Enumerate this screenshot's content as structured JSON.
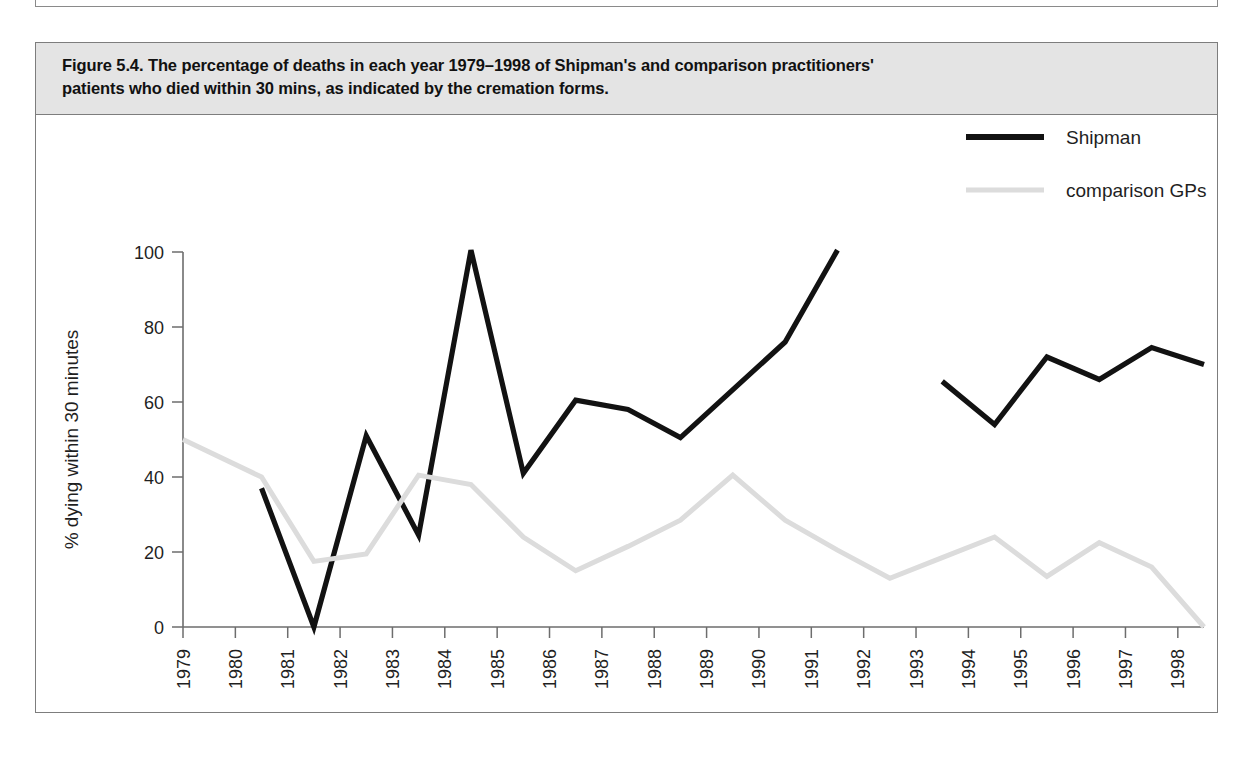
{
  "figure": {
    "caption_line1": "Figure 5.4. The percentage of deaths in each year 1979–1998 of Shipman's and comparison practitioners'",
    "caption_line2": "patients who died within 30 mins, as indicated by the cremation forms.",
    "caption_full": "Figure 5.4. The percentage of deaths in each year 1979–1998 of Shipman's and comparison practitioners' patients who died within 30 mins, as indicated by the cremation forms."
  },
  "colors": {
    "shipman": "#121212",
    "comparison": "#dcdcdc",
    "axis": "#6d6d6d",
    "caption_background": "#e4e4e4",
    "frame": "#7d7d7d",
    "text": "#1f1f1f"
  },
  "chart_data": {
    "type": "line",
    "title": "The percentage of deaths in each year 1979–1998 of Shipman's and comparison practitioners' patients who died within 30 mins, as indicated by the cremation forms.",
    "xlabel": "year",
    "ylabel": "% dying within 30 minutes",
    "xlim": [
      1979,
      1998.5
    ],
    "ylim": [
      0,
      100
    ],
    "yticks": [
      0,
      20,
      40,
      60,
      80,
      100
    ],
    "ytick_labels": [
      "0",
      "20",
      "40",
      "60",
      "80",
      "100"
    ],
    "xticks": [
      1979,
      1980,
      1981,
      1982,
      1983,
      1984,
      1985,
      1986,
      1987,
      1988,
      1989,
      1990,
      1991,
      1992,
      1993,
      1994,
      1995,
      1996,
      1997,
      1998
    ],
    "xtick_labels": [
      "1979",
      "1980",
      "1981",
      "1982",
      "1983",
      "1984",
      "1985",
      "1986",
      "1987",
      "1988",
      "1989",
      "1990",
      "1991",
      "1992",
      "1993",
      "1994",
      "1995",
      "1996",
      "1997",
      "1998"
    ],
    "grid": false,
    "legend_position": "top-right",
    "series": [
      {
        "name": "Shipman",
        "color": "#121212",
        "stroke_width": 5.2,
        "segments": [
          {
            "x": [
              1980.5,
              1981.5,
              1982.5,
              1983.5,
              1984.5,
              1985.5,
              1986.5,
              1987.5,
              1988.5,
              1990.5,
              1991.5
            ],
            "y": [
              37,
              0,
              51,
              24.5,
              100.5,
              41,
              60.5,
              58,
              50.5,
              76,
              100.5
            ]
          },
          {
            "x": [
              1993.5,
              1994.5,
              1995.5,
              1996.5,
              1997.5,
              1998.5
            ],
            "y": [
              65.5,
              54,
              72,
              66,
              74.5,
              70
            ]
          }
        ]
      },
      {
        "name": "comparison GPs",
        "color": "#dcdcdc",
        "stroke_width": 5.0,
        "segments": [
          {
            "x": [
              1979.0,
              1980.5,
              1981.5,
              1982.5,
              1983.5,
              1984.5,
              1985.5,
              1986.5,
              1987.5,
              1988.5,
              1989.5,
              1990.5,
              1991.5,
              1992.5,
              1993.5,
              1994.5,
              1995.5,
              1996.5,
              1997.5,
              1998.5
            ],
            "y": [
              50,
              40,
              17.5,
              19.5,
              40.5,
              38,
              24,
              15,
              21.5,
              28.5,
              40.5,
              28.5,
              20.5,
              13,
              18.5,
              24,
              13.5,
              22.5,
              16,
              0
            ]
          }
        ]
      }
    ],
    "legend": [
      {
        "label": "Shipman",
        "color": "#121212",
        "stroke_width": 6
      },
      {
        "label": "comparison GPs",
        "color": "#dcdcdc",
        "stroke_width": 5
      }
    ]
  }
}
